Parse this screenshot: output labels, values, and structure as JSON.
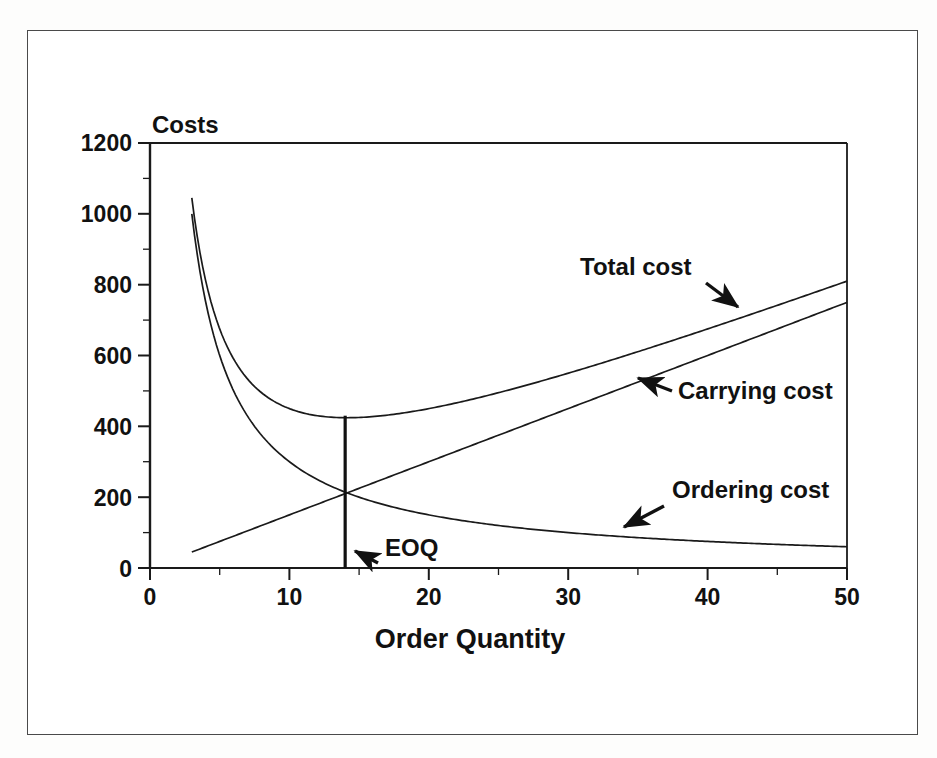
{
  "figure": {
    "frame_color": "#4a4a4a",
    "background": "#ffffff",
    "line_color": "#1a1a1a"
  },
  "chart_data": {
    "type": "line",
    "title": "",
    "xlabel": "Order Quantity",
    "ylabel": "Costs",
    "xlim": [
      0,
      50
    ],
    "ylim": [
      0,
      1200
    ],
    "xticks": [
      0,
      10,
      20,
      30,
      40,
      50
    ],
    "yticks": [
      0,
      200,
      400,
      600,
      800,
      1000,
      1200
    ],
    "xtick_labels": [
      "0",
      "10",
      "20",
      "30",
      "40",
      "50"
    ],
    "ytick_labels": [
      "0",
      "200",
      "400",
      "600",
      "800",
      "1000",
      "1200"
    ],
    "minor_tick_step_x": 5,
    "minor_tick_step_y": 100,
    "grid": false,
    "legend": "inline-annotations",
    "model": {
      "ordering_cost_constant": 3000,
      "carrying_cost_slope": 15,
      "domain_start": 3,
      "domain_end": 50
    },
    "series": [
      {
        "name": "Total cost",
        "kind": "total",
        "x": [
          3,
          4,
          5,
          6,
          7,
          8,
          9,
          10,
          11,
          12,
          13,
          14,
          15,
          16,
          18,
          20,
          22,
          25,
          28,
          30,
          34,
          38,
          42,
          46,
          50
        ],
        "values": [
          1045,
          810,
          675,
          590,
          534,
          495,
          468,
          450,
          438,
          430,
          426,
          424,
          425,
          428,
          437,
          450,
          466,
          495,
          527,
          550,
          598,
          649,
          701,
          755,
          810
        ]
      },
      {
        "name": "Ordering cost",
        "kind": "ordering",
        "x": [
          3,
          4,
          5,
          6,
          7,
          8,
          9,
          10,
          12,
          14,
          16,
          18,
          20,
          24,
          28,
          32,
          36,
          40,
          45,
          50
        ],
        "values": [
          1000,
          750,
          600,
          500,
          429,
          375,
          333,
          300,
          250,
          214,
          188,
          167,
          150,
          125,
          107,
          94,
          83,
          75,
          67,
          60
        ]
      },
      {
        "name": "Carrying cost",
        "kind": "carrying",
        "x": [
          3,
          50
        ],
        "values": [
          45,
          750
        ]
      }
    ],
    "annotations": [
      {
        "id": "total-cost",
        "label": "Total cost",
        "text_x": 580,
        "text_y": 275,
        "arrow_from": [
          706,
          283
        ],
        "arrow_to": [
          738,
          307
        ]
      },
      {
        "id": "carrying-cost",
        "label": "Carrying cost",
        "text_x": 678,
        "text_y": 399,
        "arrow_from": [
          672,
          391
        ],
        "arrow_to": [
          638,
          378
        ]
      },
      {
        "id": "ordering-cost",
        "label": "Ordering cost",
        "text_x": 672,
        "text_y": 498,
        "arrow_from": [
          664,
          506
        ],
        "arrow_to": [
          624,
          527
        ]
      },
      {
        "id": "eoq",
        "label": "EOQ",
        "text_x": 385,
        "text_y": 556,
        "arrow_from": [
          378,
          563
        ],
        "arrow_to": [
          355,
          551
        ],
        "marker_x_value": 14,
        "marker_y_value": 430
      }
    ]
  }
}
